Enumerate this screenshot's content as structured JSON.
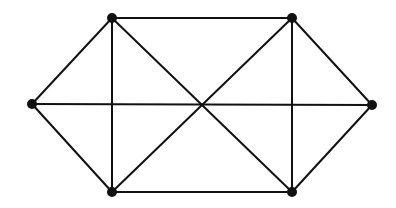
{
  "diagram": {
    "type": "graph",
    "colors": {
      "edge": "#111111",
      "node": "#111111",
      "background": "#ffffff"
    },
    "nodes": [
      {
        "id": "L",
        "x": 32,
        "y": 104
      },
      {
        "id": "TL",
        "x": 112,
        "y": 18
      },
      {
        "id": "BL",
        "x": 112,
        "y": 192
      },
      {
        "id": "TR",
        "x": 292,
        "y": 18
      },
      {
        "id": "BR",
        "x": 292,
        "y": 192
      },
      {
        "id": "R",
        "x": 372,
        "y": 105
      }
    ],
    "edges": [
      [
        "L",
        "TL"
      ],
      [
        "L",
        "BL"
      ],
      [
        "L",
        "R"
      ],
      [
        "TL",
        "TR"
      ],
      [
        "BL",
        "BR"
      ],
      [
        "TL",
        "BL"
      ],
      [
        "TR",
        "BR"
      ],
      [
        "TL",
        "BR"
      ],
      [
        "BL",
        "TR"
      ],
      [
        "TR",
        "R"
      ],
      [
        "BR",
        "R"
      ]
    ]
  }
}
